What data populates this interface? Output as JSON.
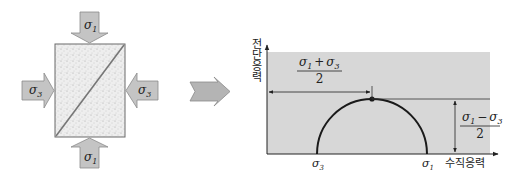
{
  "diagram": {
    "type": "mohr-circle-stress-diagram",
    "left_panel": {
      "description": "Rock specimen under principal stresses with inclined failure plane",
      "labels": {
        "top_arrow": "σ",
        "top_arrow_sub": "1",
        "bottom_arrow": "σ",
        "bottom_arrow_sub": "1",
        "left_arrow": "σ",
        "left_arrow_sub": "3",
        "right_arrow": "σ",
        "right_arrow_sub": "3"
      },
      "colors": {
        "arrow_fill": "#c4c4c4",
        "arrow_stroke": "#7a7a7a",
        "specimen_fill": "#ededed",
        "specimen_stroke": "#6a6a6a"
      }
    },
    "transition_arrow": {
      "fill": "#b4b4b4",
      "stroke": "#8a8a8a"
    },
    "right_panel": {
      "y_axis_label": "전단응력",
      "x_axis_label": "수직응력",
      "x_tick_left": "σ",
      "x_tick_left_sub": "3",
      "x_tick_right": "σ",
      "x_tick_right_sub": "1",
      "center_label_num": "σ₁ + σ₃",
      "center_label_num_a": "σ",
      "center_label_num_a_sub": "1",
      "center_label_op": "+",
      "center_label_num_b": "σ",
      "center_label_num_b_sub": "3",
      "center_label_den": "2",
      "radius_label_num_a": "σ",
      "radius_label_num_a_sub": "1",
      "radius_label_op": "−",
      "radius_label_num_b": "σ",
      "radius_label_num_b_sub": "3",
      "radius_label_den": "2",
      "colors": {
        "plot_bg": "#d7d7d7",
        "circle": "#1a1a1a",
        "lines": "#333333"
      }
    }
  }
}
